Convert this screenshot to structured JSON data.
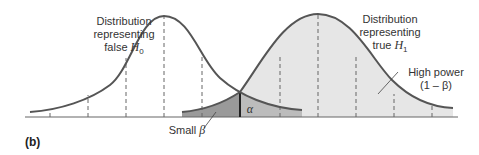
{
  "figure": {
    "panel_label": "(b)",
    "h0_label": {
      "line1": "Distribution",
      "line2": "representing",
      "line3_prefix": "false ",
      "symbol": "H",
      "subscript": "0"
    },
    "h1_label": {
      "line1": "Distribution",
      "line2": "representing",
      "line3_prefix": "true ",
      "symbol": "H",
      "subscript": "1"
    },
    "power_label": {
      "line1": "High power",
      "line2": "(1 – β)"
    },
    "beta_label": {
      "prefix": "Small ",
      "symbol": "β"
    },
    "alpha_label": "α",
    "colors": {
      "curve": "#555555",
      "h1_fill": "#e6e6e6",
      "beta_fill": "#9a9a9a",
      "alpha_fill": "#bcbcbc",
      "axis": "#666666",
      "dash": "#666666"
    }
  }
}
